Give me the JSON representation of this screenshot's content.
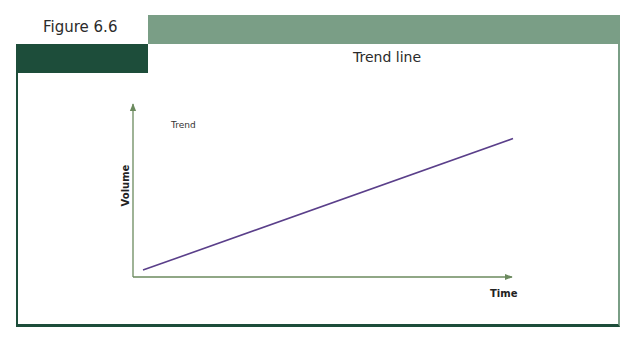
{
  "figure": {
    "label": "Figure 6.6",
    "title": "Trend line",
    "colors": {
      "dark_green": "#1d4d3a",
      "light_green": "#7a9e86",
      "axis": "#6b8a5e",
      "line": "#5a3f8a"
    }
  },
  "chart_data": {
    "type": "line",
    "title": "Trend line",
    "xlabel": "Time",
    "ylabel": "Volume",
    "annotations": [
      "Trend"
    ],
    "grid": false,
    "legend": null,
    "series": [
      {
        "name": "Trend",
        "x": [
          0,
          1
        ],
        "values": [
          0.04,
          0.8
        ]
      }
    ],
    "xlim": [
      0,
      1
    ],
    "ylim": [
      0,
      1
    ],
    "tick_labels": {
      "x": [],
      "y": []
    }
  }
}
